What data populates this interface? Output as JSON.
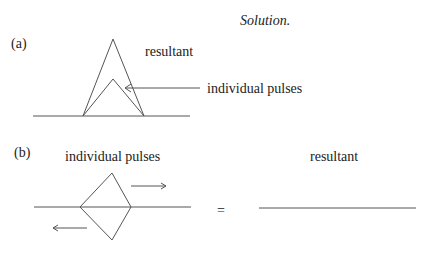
{
  "header": {
    "title": "Solution."
  },
  "part_a": {
    "label": "(a)",
    "resultant_label": "resultant",
    "pulses_label": "individual pulses"
  },
  "part_b": {
    "label": "(b)",
    "pulses_label": "individual pulses",
    "equals": "=",
    "resultant_label": "resultant"
  }
}
